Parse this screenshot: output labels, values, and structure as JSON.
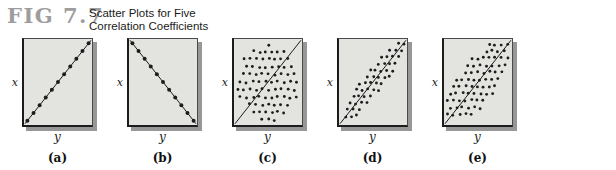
{
  "figure": {
    "tag": "FIG 7.7",
    "title_line1": "Scatter Plots for Five",
    "title_line2": "Correlation Coefficients"
  },
  "colors": {
    "fig_tag": "#9d9d9d",
    "title_text": "#1a1a1a",
    "panel_fill": "#e3e3e0",
    "panel_shadow": "#979797",
    "dot": "#1c1c1c",
    "line": "#1c1c1c"
  },
  "chart_data": [
    {
      "panel": "a",
      "type": "scatter",
      "caption": "(a)",
      "xlabel": "y",
      "ylabel": "x",
      "relationship": "perfect positive",
      "trend_line": true,
      "line": "positive",
      "pattern": {
        "kind": "perfect",
        "direction": "positive",
        "dot_count": 11
      }
    },
    {
      "panel": "b",
      "type": "scatter",
      "caption": "(b)",
      "xlabel": "y",
      "ylabel": "x",
      "relationship": "perfect negative",
      "trend_line": true,
      "line": "negative",
      "pattern": {
        "kind": "perfect",
        "direction": "negative",
        "dot_count": 11
      }
    },
    {
      "panel": "c",
      "type": "scatter",
      "caption": "(c)",
      "xlabel": "y",
      "ylabel": "x",
      "relationship": "none (circular cloud)",
      "trend_line": true,
      "line": "positive",
      "pattern": {
        "kind": "cloud",
        "shape": "circle",
        "cx": 50,
        "cy": 51,
        "rx": 45,
        "ry": 45,
        "row_step": 8.8,
        "col_step": 9.2,
        "seed": 3
      }
    },
    {
      "panel": "d",
      "type": "scatter",
      "caption": "(d)",
      "xlabel": "y",
      "ylabel": "x",
      "relationship": "strong positive (narrow ellipse)",
      "trend_line": true,
      "line": "positive",
      "pattern": {
        "kind": "cloud",
        "shape": "ellipse-diagonal",
        "a": 64,
        "b": 14,
        "row_step": 7.6,
        "col_step": 8.2,
        "seed": 7
      }
    },
    {
      "panel": "e",
      "type": "scatter",
      "caption": "(e)",
      "xlabel": "y",
      "ylabel": "x",
      "relationship": "moderate positive (wide ellipse)",
      "trend_line": true,
      "line": "positive",
      "pattern": {
        "kind": "cloud",
        "shape": "ellipse-diagonal",
        "a": 64,
        "b": 26,
        "row_step": 8.2,
        "col_step": 8.8,
        "seed": 11
      }
    }
  ]
}
